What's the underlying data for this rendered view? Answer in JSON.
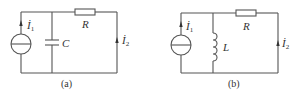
{
  "diagrams": [
    {
      "id": "a",
      "caption": "(a)",
      "source_label": "İ",
      "source_sub": "1",
      "shunt_component": "capacitor",
      "shunt_label": "C",
      "series_label": "R",
      "output_label": "İ",
      "output_sub": "2"
    },
    {
      "id": "b",
      "caption": "(b)",
      "source_label": "İ",
      "source_sub": "1",
      "shunt_component": "inductor",
      "shunt_label": "L",
      "series_label": "R",
      "output_label": "İ",
      "output_sub": "2"
    }
  ],
  "colors": {
    "wire": "#555555",
    "text": "#333333",
    "background": "#ffffff"
  }
}
